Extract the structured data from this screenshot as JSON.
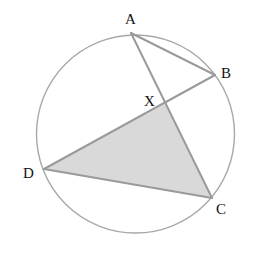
{
  "diagram": {
    "type": "circle-geometry",
    "circle": {
      "cx": 135.5,
      "cy": 134,
      "r": 99,
      "stroke": "#a8a8a8",
      "stroke_width": 1.4
    },
    "points": {
      "A": {
        "label": "A",
        "x": 131,
        "y": 33,
        "label_x": 125,
        "label_y": 24
      },
      "B": {
        "label": "B",
        "x": 215,
        "y": 75,
        "label_x": 221,
        "label_y": 78
      },
      "X": {
        "label": "X",
        "x": 165,
        "y": 104,
        "label_x": 144,
        "label_y": 106
      },
      "D": {
        "label": "D",
        "x": 44,
        "y": 169,
        "label_x": 23,
        "label_y": 178
      },
      "C": {
        "label": "C",
        "x": 212,
        "y": 198,
        "label_x": 216,
        "label_y": 214
      }
    },
    "segments": [
      {
        "from": "A",
        "to": "B"
      },
      {
        "from": "A",
        "to": "C"
      },
      {
        "from": "B",
        "to": "D"
      },
      {
        "from": "D",
        "to": "C"
      }
    ],
    "shaded_region": {
      "vertices": [
        "D",
        "X",
        "C"
      ],
      "fill": "#d9d9d9"
    },
    "line_color": "#9a9a9a",
    "line_width": 2
  }
}
